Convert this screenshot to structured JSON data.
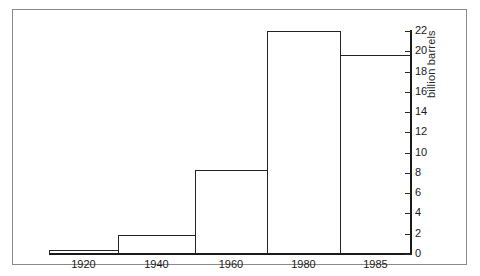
{
  "chart_data": {
    "type": "bar",
    "title": "",
    "xlabel": "",
    "ylabel": "billion barrels",
    "ylim": [
      0,
      22
    ],
    "grid": false,
    "legend": null,
    "categories": [
      "1920",
      "1940",
      "1960",
      "1980",
      "1985"
    ],
    "values": [
      0.4,
      1.9,
      8.3,
      22.0,
      19.6
    ],
    "y_ticks": [
      "0",
      "2",
      "4",
      "6",
      "8",
      "10",
      "12",
      "14",
      "16",
      "18",
      "20",
      "22"
    ],
    "y_tick_values": [
      0,
      2,
      4,
      6,
      8,
      10,
      12,
      14,
      16,
      18,
      20,
      22
    ],
    "x_tick_labels": [
      "1920",
      "1940",
      "1960",
      "1980",
      "1985"
    ],
    "axis_position": "right",
    "bars": [
      {
        "label": "1920",
        "value": 0.4
      },
      {
        "label": "1940",
        "value": 1.9
      },
      {
        "label": "1960",
        "value": 8.3
      },
      {
        "label": "1980",
        "value": 22.0
      },
      {
        "label": "1985",
        "value": 19.6
      }
    ],
    "colors": {
      "bar_outline": "#232323",
      "bar_fill": "#ffffff",
      "axis": "#1a1a1a",
      "frame": "#8a8a8a",
      "background": "#ffffff"
    }
  }
}
